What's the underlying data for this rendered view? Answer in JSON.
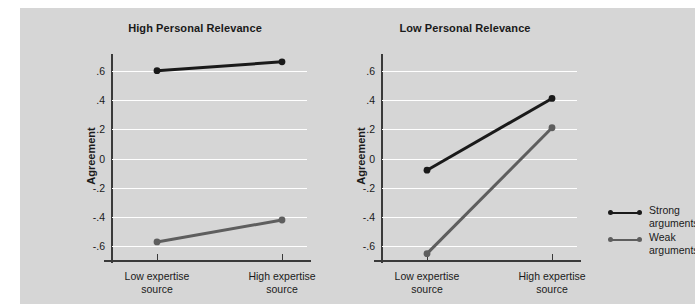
{
  "chart_data": {
    "type": "line",
    "title": "",
    "panels": [
      {
        "id": "high",
        "title": "High Personal Relevance",
        "xlabel": "",
        "ylabel": "Agreement",
        "categories": [
          "Low expertise source",
          "High expertise source"
        ],
        "category_lines": [
          [
            "Low expertise",
            "source"
          ],
          [
            "High expertise",
            "source"
          ]
        ],
        "ylim": [
          -0.7,
          0.7
        ],
        "yticks": [
          0.6,
          0.4,
          0.2,
          0,
          -0.2,
          -0.4,
          -0.6
        ],
        "ytick_labels": [
          ".6",
          ".4",
          ".2",
          "0",
          "-.2",
          "-.4",
          "-.6"
        ],
        "grid": true,
        "series": [
          {
            "name": "Strong arguments",
            "values": [
              0.6,
              0.66
            ],
            "color": "#1a1a1a"
          },
          {
            "name": "Weak arguments",
            "values": [
              -0.57,
              -0.42
            ],
            "color": "#5e5e5e"
          }
        ]
      },
      {
        "id": "low",
        "title": "Low Personal Relevance",
        "xlabel": "",
        "ylabel": "Agreement",
        "categories": [
          "Low expertise source",
          "High expertise source"
        ],
        "category_lines": [
          [
            "Low expertise",
            "source"
          ],
          [
            "High expertise",
            "source"
          ]
        ],
        "ylim": [
          -0.7,
          0.7
        ],
        "yticks": [
          0.6,
          0.4,
          0.2,
          0,
          -0.2,
          -0.4,
          -0.6
        ],
        "ytick_labels": [
          ".6",
          ".4",
          ".2",
          "0",
          "-.2",
          "-.4",
          "-.6"
        ],
        "grid": true,
        "series": [
          {
            "name": "Strong arguments",
            "values": [
              -0.08,
              0.41
            ],
            "color": "#1a1a1a"
          },
          {
            "name": "Weak arguments",
            "values": [
              -0.65,
              0.21
            ],
            "color": "#5e5e5e"
          }
        ]
      }
    ],
    "legend": {
      "position": "right",
      "entries": [
        {
          "label_lines": [
            "Strong",
            "arguments"
          ],
          "label": "Strong arguments",
          "color": "#1a1a1a"
        },
        {
          "label_lines": [
            "Weak",
            "arguments"
          ],
          "label": "Weak arguments",
          "color": "#5e5e5e"
        }
      ]
    },
    "colors": {
      "figure_background": "#d6d6d6",
      "page_background": "#ffffff",
      "gridline": "#ffffff",
      "axis": "#3a3a3a",
      "text": "#1a1a1a",
      "strong_series": "#1a1a1a",
      "weak_series": "#5e5e5e"
    }
  }
}
